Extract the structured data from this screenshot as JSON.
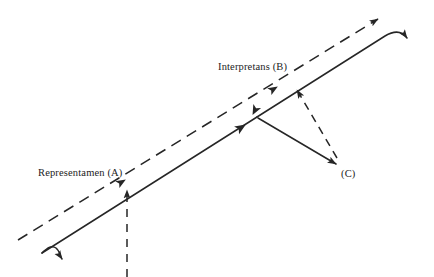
{
  "diagram": {
    "background_color": "#ffffff",
    "stroke_color": "#262626",
    "labels": {
      "representamen": "Representamen (A)",
      "interpretans": "Interpretans (B)",
      "object": "(C)"
    },
    "edges": [
      {
        "name": "dashed-main-diagonal",
        "style": "dashed",
        "from": "lower-left",
        "to": "upper-right",
        "arrowheads": [
          "mid-at-representamen",
          "mid-at-interpretans",
          "end-upper-right"
        ]
      },
      {
        "name": "solid-main-diagonal",
        "style": "solid",
        "from": "lower-left-curl",
        "to": "upper-right-curl",
        "arrowheads": [
          "start-down-left",
          "mid-at-junction",
          "end-down-right"
        ]
      },
      {
        "name": "vertical-dashed-into-representamen",
        "style": "dashed",
        "from": "bottom",
        "to": "representamen",
        "arrowheads": [
          "end-up"
        ]
      },
      {
        "name": "junction-to-object",
        "style": "solid",
        "from": "junction",
        "to": "object",
        "arrowheads": [
          "end-down-right"
        ]
      },
      {
        "name": "object-to-interpretans",
        "style": "dashed",
        "from": "object",
        "to": "interpretans",
        "arrowheads": [
          "end-up-left"
        ]
      }
    ]
  }
}
